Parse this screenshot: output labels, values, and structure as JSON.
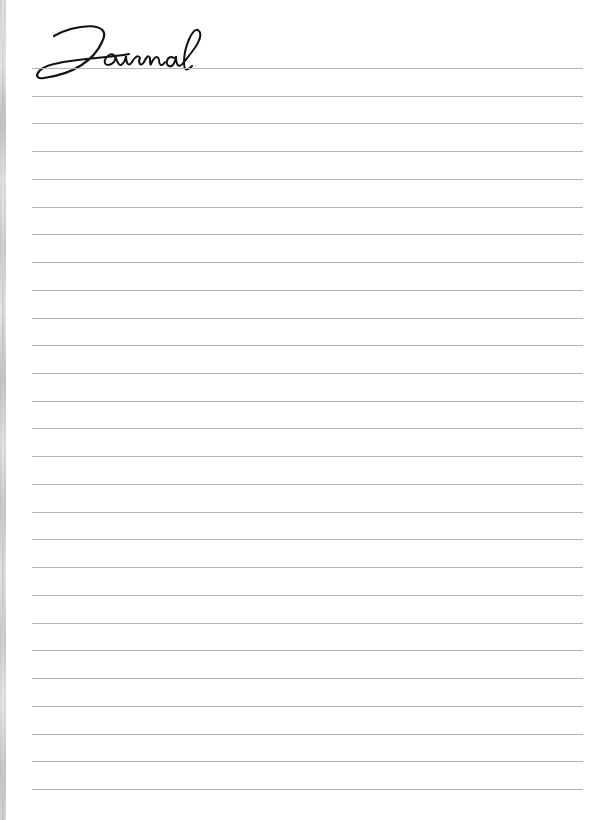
{
  "page": {
    "title": "Journal",
    "line_count": 27,
    "line_color": "#b4b4b4",
    "first_line_y": 68,
    "line_spacing": 27.73
  }
}
